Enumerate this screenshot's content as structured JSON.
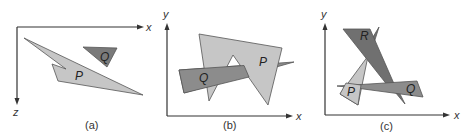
{
  "colors": {
    "light_poly": "#c6c6c6",
    "medium_poly": "#8c8c8c",
    "dark_poly": "#707070",
    "axis": "#333333"
  },
  "panels": [
    {
      "caption": "(a)",
      "axes": {
        "horizontal": "x",
        "vertical": "z"
      },
      "polygons": [
        {
          "label": "P",
          "shade": "light"
        },
        {
          "label": "Q",
          "shade": "dark"
        }
      ]
    },
    {
      "caption": "(b)",
      "axes": {
        "horizontal": "x",
        "vertical": "y"
      },
      "polygons": [
        {
          "label": "P",
          "shade": "light"
        },
        {
          "label": "Q",
          "shade": "medium"
        }
      ]
    },
    {
      "caption": "(c)",
      "axes": {
        "horizontal": "x",
        "vertical": "y"
      },
      "polygons": [
        {
          "label": "R",
          "shade": "dark"
        },
        {
          "label": "P",
          "shade": "light"
        },
        {
          "label": "Q",
          "shade": "medium"
        }
      ]
    }
  ]
}
